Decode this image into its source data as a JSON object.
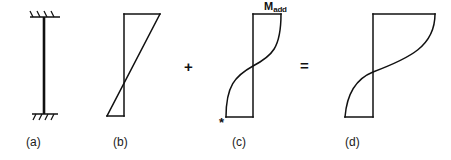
{
  "figure": {
    "width": 451,
    "height": 160,
    "background": "#ffffff",
    "stroke_color": "#111111"
  },
  "panels": [
    {
      "id": "a",
      "caption": "(a)",
      "caption_x": 26,
      "caption_y": 136,
      "type": "column-elevation",
      "column": {
        "x": 44,
        "top_y": 17,
        "bottom_y": 114,
        "line_width": 2.4
      },
      "supports": [
        {
          "name": "top-fixed-support",
          "y": 17,
          "x_start": 30,
          "x_end": 60,
          "hatch_count": 4,
          "hatch_direction": "up-right"
        },
        {
          "name": "bottom-fixed-support",
          "y": 114,
          "x_start": 32,
          "x_end": 58,
          "hatch_count": 4,
          "hatch_direction": "down-right"
        }
      ]
    },
    {
      "id": "b",
      "caption": "(b)",
      "caption_x": 113,
      "caption_y": 136,
      "type": "linear-moment-diagram",
      "axis_x": 124,
      "top_y": 14,
      "bottom_y": 116,
      "top_right_x": 160,
      "bottom_left_x": 107,
      "diagonal": {
        "from_x": 160,
        "from_y": 14,
        "to_x": 107,
        "to_y": 116
      },
      "shape": "double-triangle"
    },
    {
      "id": "c",
      "caption": "(c)",
      "caption_x": 232,
      "caption_y": 136,
      "type": "additional-moment-diagram",
      "axis_x": 253,
      "top_y": 14,
      "bottom_y": 117,
      "top_right_x": 281,
      "bottom_left_x": 226,
      "curve": "s-curve",
      "label": {
        "text_main": "M",
        "text_sub": "add",
        "x": 264,
        "y": 1
      },
      "marker": {
        "name": "asterisk",
        "text": "*",
        "x": 219,
        "y": 118
      }
    },
    {
      "id": "d",
      "caption": "(d)",
      "caption_x": 345,
      "caption_y": 136,
      "type": "total-moment-diagram",
      "axis_x": 373,
      "top_y": 14,
      "bottom_y": 117,
      "top_right_x": 435,
      "bottom_left_x": 345,
      "curve": "s-curve",
      "shape": "combined"
    }
  ],
  "operators": [
    {
      "name": "plus-operator",
      "symbol": "+",
      "x": 184,
      "y": 59
    },
    {
      "name": "equals-operator",
      "symbol": "=",
      "x": 300,
      "y": 58
    }
  ]
}
